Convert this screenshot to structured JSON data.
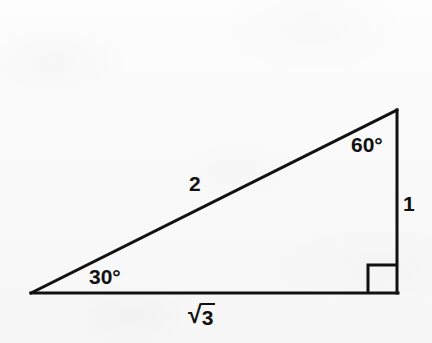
{
  "figure": {
    "kind": "geometry-diagram",
    "background_color": "#fbfbfc",
    "stroke_color": "#111111"
  },
  "triangle": {
    "vertices": {
      "bottom_left": {
        "x": 31,
        "y": 293
      },
      "bottom_right": {
        "x": 397,
        "y": 293
      },
      "apex": {
        "x": 397,
        "y": 110
      }
    },
    "right_angle_marker": {
      "corner": "bottom-right",
      "size": 28
    }
  },
  "labels": {
    "angle_bottom_left": "30°",
    "angle_apex": "60°",
    "side_vertical": "1",
    "side_hypotenuse": "2",
    "side_base_radical": "√",
    "side_base_radicand": "3"
  }
}
